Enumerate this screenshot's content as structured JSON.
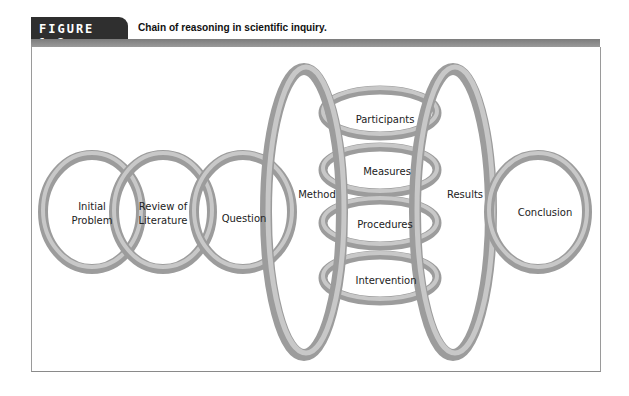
{
  "figure": {
    "tab_label": "FIGURE 1.2",
    "title": "Chain of reasoning in scientific inquiry."
  },
  "colors": {
    "tab_bg": "#2f2f2f",
    "band": "#8a8a8a",
    "ring_dark": "#9c9c9c",
    "ring_light": "#c8c8c8"
  },
  "diagram": {
    "chain": [
      {
        "id": "initial-problem",
        "line1": "Initial",
        "line2": "Problem"
      },
      {
        "id": "review-of-literature",
        "line1": "Review of",
        "line2": "Literature"
      },
      {
        "id": "question",
        "label": "Question"
      },
      {
        "id": "method",
        "label": "Method"
      },
      {
        "id": "results",
        "label": "Results"
      },
      {
        "id": "conclusion",
        "label": "Conclusion"
      }
    ],
    "method_components": [
      {
        "id": "participants",
        "label": "Participants"
      },
      {
        "id": "measures",
        "label": "Measures"
      },
      {
        "id": "procedures",
        "label": "Procedures"
      },
      {
        "id": "intervention",
        "label": "Intervention"
      }
    ]
  }
}
